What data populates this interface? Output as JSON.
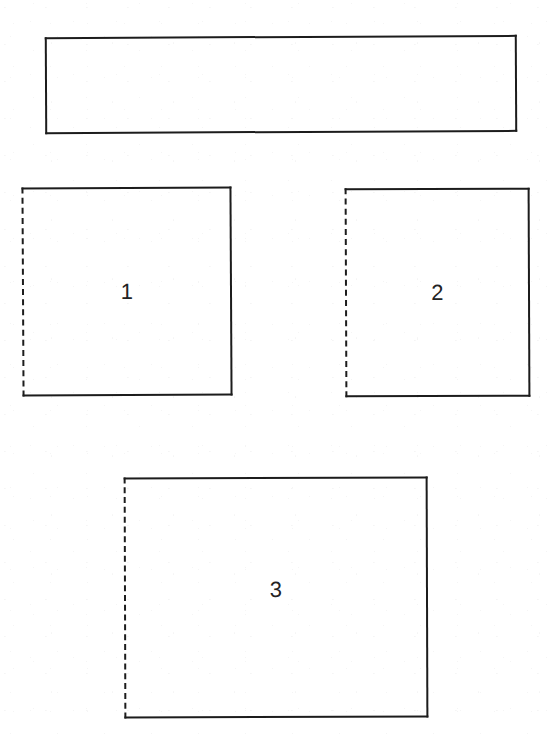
{
  "document": {
    "kind": "scanned-line-drawing",
    "background_color": "#ffffff",
    "ink_color": "#1c1c1c",
    "label_color": "#232323",
    "width": 548,
    "height": 736
  },
  "figure": {
    "shapes": [
      {
        "id": "header-bar",
        "label": "",
        "x": 45,
        "y": 36,
        "width": 472,
        "height": 97,
        "edges": {
          "top": "solid",
          "right": "solid",
          "bottom": "solid",
          "left": "solid"
        }
      },
      {
        "id": "box-1",
        "label": "1",
        "x": 22,
        "y": 187,
        "width": 210,
        "height": 209,
        "edges": {
          "top": "solid",
          "right": "solid",
          "bottom": "solid",
          "left": "dashed"
        }
      },
      {
        "id": "box-2",
        "label": "2",
        "x": 345,
        "y": 188,
        "width": 185,
        "height": 209,
        "edges": {
          "top": "solid",
          "right": "solid",
          "bottom": "solid",
          "left": "dashed"
        }
      },
      {
        "id": "box-3",
        "label": "3",
        "x": 124,
        "y": 477,
        "width": 304,
        "height": 241,
        "edges": {
          "top": "solid",
          "right": "solid",
          "bottom": "solid",
          "left": "dashed"
        }
      }
    ]
  }
}
